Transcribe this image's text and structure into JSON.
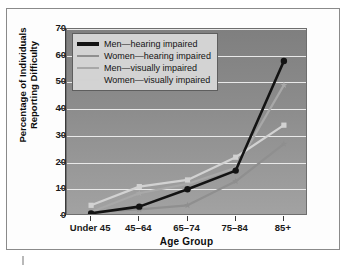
{
  "chart_data": {
    "type": "line",
    "title": "",
    "xlabel": "Age Group",
    "ylabel": "Percentage of Individuals Reporting Difficulty",
    "ylabel_line1": "Percentage of Individuals",
    "ylabel_line2": "Reporting Difficulty",
    "categories": [
      "Under 45",
      "45–64",
      "65–74",
      "75–84",
      "85+"
    ],
    "ylim": [
      0,
      70
    ],
    "yticks": [
      0,
      10,
      20,
      30,
      40,
      50,
      60,
      70
    ],
    "grid": true,
    "legend_position": "top-left",
    "series": [
      {
        "name": "Men—hearing impaired",
        "color": "#131313",
        "marker": "circle",
        "values": [
          1,
          3.5,
          10,
          17,
          58
        ]
      },
      {
        "name": "Women—hearing impaired",
        "color": "#8f8f8f",
        "marker": "star",
        "values": [
          1.5,
          2.5,
          4,
          13,
          27
        ]
      },
      {
        "name": "Men—visually impaired",
        "color": "#a8a8a8",
        "marker": "star",
        "values": [
          1.5,
          8.5,
          12,
          18,
          49
        ]
      },
      {
        "name": "Women—visually impaired",
        "color": "#d2d2d2",
        "marker": "square",
        "values": [
          4,
          11,
          13.5,
          22,
          34
        ]
      }
    ]
  }
}
